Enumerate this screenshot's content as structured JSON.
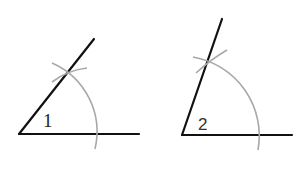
{
  "figures": [
    {
      "label": "1",
      "vertex": [
        19,
        134
      ],
      "ray_end": [
        94,
        39
      ],
      "base_end": [
        139,
        134
      ],
      "arc": {
        "from": [
          52,
          63
        ],
        "to": [
          95,
          149
        ],
        "radius": 75
      },
      "tick_arc": {
        "from": [
          52,
          82
        ],
        "to": [
          87,
          68
        ]
      }
    },
    {
      "label": "2",
      "vertex": [
        182,
        135
      ],
      "ray_end": [
        222,
        19
      ],
      "base_end": [
        292,
        135
      ],
      "arc": {
        "from": [
          193,
          57
        ],
        "to": [
          258,
          150
        ],
        "radius": 78
      },
      "tick_arc": {
        "from": [
          196,
          73
        ],
        "to": [
          227,
          50
        ]
      }
    }
  ],
  "colors": {
    "line": "#111111",
    "construction_arc": "#a8a8a8",
    "background": "#ffffff"
  }
}
